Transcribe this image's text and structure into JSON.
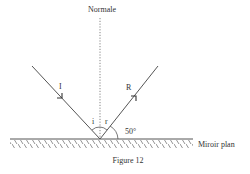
{
  "diagram": {
    "normal_label": "Normale",
    "incident_label": "I",
    "reflected_label": "R",
    "angle_i_label": "i",
    "angle_r_label": "r",
    "angle_value_label": "50°",
    "mirror_label": "Miroir plan",
    "caption": "Figure 12",
    "colors": {
      "line": "#555555",
      "text": "#333333"
    }
  }
}
